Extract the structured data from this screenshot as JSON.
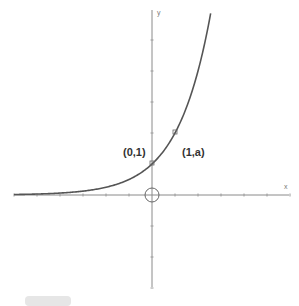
{
  "caption": "",
  "chart_data": {
    "type": "line",
    "function": "y = a^x (a = 2)",
    "base_a": 2,
    "title": "",
    "xlabel": "x",
    "ylabel": "y",
    "xlim": [
      -6,
      6
    ],
    "ylim": [
      -3,
      6
    ],
    "grid": false,
    "series": [
      {
        "name": "y = a^x",
        "x": [
          -6,
          -5,
          -4,
          -3,
          -2,
          -1,
          0,
          1,
          2,
          2.58
        ],
        "y": [
          0.016,
          0.031,
          0.063,
          0.125,
          0.25,
          0.5,
          1,
          2,
          4,
          6
        ]
      }
    ],
    "annotations": [
      {
        "text": "(0,1)",
        "x": 0,
        "y": 1
      },
      {
        "text": "(1,a)",
        "x": 1,
        "y": 2
      }
    ],
    "origin_marker": "circle"
  },
  "labels": {
    "point_0_1": "(0,1)",
    "point_1_a": "(1,a)",
    "x_axis": "x",
    "y_axis": "y"
  },
  "colors": {
    "curve": "#555555",
    "axis": "#888888",
    "text": "#333333"
  }
}
